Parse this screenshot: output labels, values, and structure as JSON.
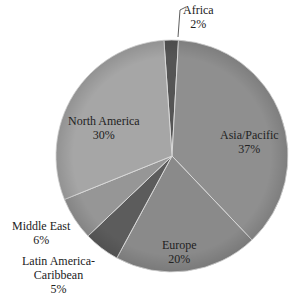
{
  "chart_data": {
    "type": "pie",
    "title": "",
    "categories": [
      "Africa",
      "Asia/Pacific",
      "Europe",
      "Latin America-Caribbean",
      "Middle East",
      "North America"
    ],
    "values": [
      2,
      37,
      20,
      5,
      6,
      30
    ],
    "unit": "%",
    "colors": [
      "#555555",
      "#8f8f8f",
      "#8a8a8a",
      "#5c5c5c",
      "#969696",
      "#a6a6a6"
    ],
    "start_angle_deg": -4,
    "legend": "none (data labels)"
  },
  "labels": {
    "africa": {
      "name": "Africa",
      "pct": "2%"
    },
    "asia": {
      "name": "Asia/Pacific",
      "pct": "37%"
    },
    "europe": {
      "name": "Europe",
      "pct": "20%"
    },
    "latam": {
      "name1": "Latin America-",
      "name2": "Caribbean",
      "pct": "5%"
    },
    "mideast": {
      "name": "Middle East",
      "pct": "6%"
    },
    "namerica": {
      "name": "North America",
      "pct": "30%"
    }
  }
}
